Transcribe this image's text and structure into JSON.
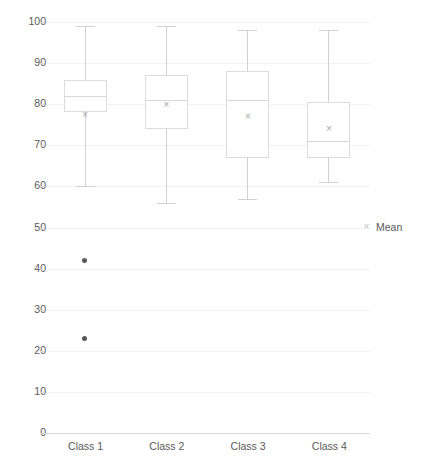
{
  "chart_data": {
    "type": "box",
    "title": "",
    "xlabel": "",
    "ylabel": "",
    "ylim": [
      0,
      100
    ],
    "ytick_step": 10,
    "yticks": [
      "100",
      "90",
      "80",
      "70",
      "60",
      "50",
      "40",
      "30",
      "20",
      "10",
      "0"
    ],
    "grid": true,
    "legend_position": "right",
    "legend": [
      {
        "label": "Mean",
        "marker": "×",
        "marker_name": "mean-x-marker",
        "color": "#bfbfbf"
      }
    ],
    "categories": [
      "Class 1",
      "Class 2",
      "Class 3",
      "Class 4"
    ],
    "boxes": [
      {
        "category": "Class 1",
        "whisker_low": 60,
        "q1": 78,
        "median": 82,
        "q3": 86,
        "whisker_high": 99,
        "mean": 77.5,
        "outliers": [
          42,
          23
        ]
      },
      {
        "category": "Class 2",
        "whisker_low": 56,
        "q1": 74,
        "median": 81,
        "q3": 87,
        "whisker_high": 99,
        "mean": 80,
        "outliers": []
      },
      {
        "category": "Class 3",
        "whisker_low": 57,
        "q1": 67,
        "median": 81,
        "q3": 88,
        "whisker_high": 98,
        "mean": 77,
        "outliers": []
      },
      {
        "category": "Class 4",
        "whisker_low": 61,
        "q1": 67,
        "median": 71,
        "q3": 80.5,
        "whisker_high": 98,
        "mean": 74,
        "outliers": []
      }
    ]
  },
  "colors": {
    "box_stroke": "#dcdcdc",
    "whisker": "#d0d0d0",
    "median": "#d8d8d8",
    "grid": "#f2f2f2",
    "text": "#595959",
    "outlier": "#595959",
    "mean": "#a6a6a6"
  }
}
